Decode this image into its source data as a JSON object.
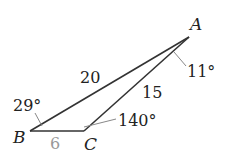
{
  "diagram": {
    "type": "triangle",
    "vertices": {
      "A": {
        "label": "A",
        "x": 189,
        "y": 37
      },
      "B": {
        "label": "B",
        "x": 30,
        "y": 131
      },
      "C": {
        "label": "C",
        "x": 84,
        "y": 131
      }
    },
    "sides": {
      "AB": {
        "label": "20"
      },
      "AC": {
        "label": "15"
      },
      "BC": {
        "label": "6"
      }
    },
    "angles": {
      "A": {
        "label": "11°"
      },
      "B": {
        "label": "29°"
      },
      "C": {
        "label": "140°"
      }
    },
    "colors": {
      "line": "#333333",
      "text": "#222222",
      "muted_text": "#999999",
      "leader": "#888888"
    }
  }
}
